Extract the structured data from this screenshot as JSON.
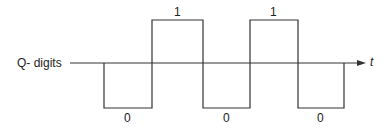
{
  "diagram": {
    "axis_label": "Q- digits",
    "time_label": "t",
    "bits": [
      {
        "value": "0",
        "label": "0"
      },
      {
        "value": "1",
        "label": "1"
      },
      {
        "value": "0",
        "label": "0"
      },
      {
        "value": "1",
        "label": "1"
      },
      {
        "value": "0",
        "label": "0"
      }
    ],
    "stroke_color": "#333333"
  }
}
